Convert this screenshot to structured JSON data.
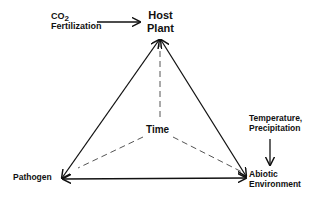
{
  "diagram": {
    "nodes": {
      "host": {
        "line1": "Host",
        "line2": "Plant"
      },
      "pathogen": {
        "label": "Pathogen"
      },
      "abiotic": {
        "line1": "Abiotic",
        "line2": "Environment"
      },
      "time": {
        "label": "Time"
      }
    },
    "drivers": {
      "co2": {
        "prefix": "CO",
        "subscript": "2",
        "line2": "Fertilization"
      },
      "temperature": {
        "line1": "Temperature,",
        "line2": "Precipitation"
      }
    },
    "edges": [
      {
        "from": "host",
        "to": "pathogen",
        "style": "solid",
        "arrows": "both"
      },
      {
        "from": "host",
        "to": "abiotic",
        "style": "solid",
        "arrows": "both"
      },
      {
        "from": "pathogen",
        "to": "abiotic",
        "style": "solid",
        "arrows": "both"
      },
      {
        "from": "time",
        "to": "host",
        "style": "dashed"
      },
      {
        "from": "time",
        "to": "pathogen",
        "style": "dashed"
      },
      {
        "from": "time",
        "to": "abiotic",
        "style": "dashed"
      },
      {
        "from": "co2",
        "to": "host",
        "style": "solid",
        "arrows": "end"
      },
      {
        "from": "temperature",
        "to": "abiotic",
        "style": "solid",
        "arrows": "end"
      }
    ],
    "colors": {
      "line": "#111111",
      "dashed": "#555555",
      "background": "#ffffff"
    }
  }
}
